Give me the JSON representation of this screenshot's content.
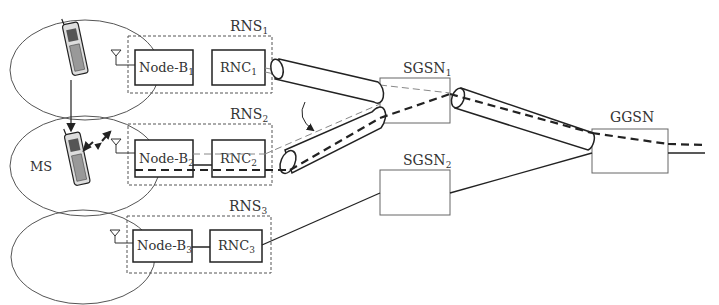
{
  "diagram": {
    "rns": [
      {
        "label": "RNS",
        "sub": "1",
        "node_b": "Node-B",
        "node_b_sub": "1",
        "rnc": "RNC",
        "rnc_sub": "1"
      },
      {
        "label": "RNS",
        "sub": "2",
        "node_b": "Node-B",
        "node_b_sub": "2",
        "rnc": "RNC",
        "rnc_sub": "2"
      },
      {
        "label": "RNS",
        "sub": "3",
        "node_b": "Node-B",
        "node_b_sub": "3",
        "rnc": "RNC",
        "rnc_sub": "3"
      }
    ],
    "ms_label": "MS",
    "sgsn": [
      {
        "label": "SGSN",
        "sub": "1"
      },
      {
        "label": "SGSN",
        "sub": "2"
      }
    ],
    "ggsn_label": "GGSN",
    "colors": {
      "stroke": "#222222",
      "light_stroke": "#888888",
      "dashed_box": "#555555"
    }
  }
}
